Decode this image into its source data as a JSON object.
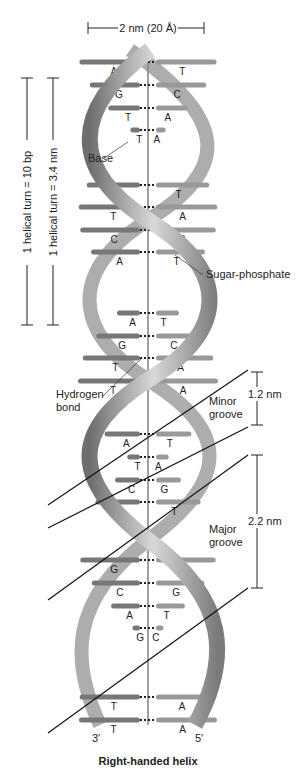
{
  "width_label": "2 nm (20 Å)",
  "turn_bp_label": "1 helical turn = 10 bp",
  "turn_nm_label": "1 helical turn = 3.4 nm",
  "labels": {
    "base": "Base",
    "sugar_phosphate": "Sugar-phosphate",
    "hydrogen_bond_1": "Hydrogen",
    "hydrogen_bond_2": "bond",
    "minor_groove_1": "Minor",
    "minor_groove_2": "groove",
    "major_groove_1": "Major",
    "major_groove_2": "groove",
    "minor_dim": "1.2 nm",
    "major_dim": "2.2 nm",
    "end_left": "3′",
    "end_right": "5′",
    "caption": "Right-handed helix"
  },
  "base_pairs": [
    {
      "l": "A",
      "r": "T"
    },
    {
      "l": "G",
      "r": "C"
    },
    {
      "l": "T",
      "r": "A"
    },
    {
      "l": "T",
      "r": "A"
    },
    {
      "l": "A",
      "r": "T"
    },
    {
      "l": "T",
      "r": "A"
    },
    {
      "l": "C",
      "r": "G"
    },
    {
      "l": "A",
      "r": "T"
    },
    {
      "l": "A",
      "r": "T"
    },
    {
      "l": "G",
      "r": "C"
    },
    {
      "l": "T",
      "r": "A"
    },
    {
      "l": "T",
      "r": "A"
    },
    {
      "l": "A",
      "r": "T"
    },
    {
      "l": "T",
      "r": "A"
    },
    {
      "l": "C",
      "r": "G"
    },
    {
      "l": "A",
      "r": "T"
    },
    {
      "l": "G",
      "r": "C"
    },
    {
      "l": "C",
      "r": "G"
    },
    {
      "l": "A",
      "r": "T"
    },
    {
      "l": "G",
      "r": "C"
    },
    {
      "l": "T",
      "r": "A"
    },
    {
      "l": "T",
      "r": "A"
    }
  ]
}
